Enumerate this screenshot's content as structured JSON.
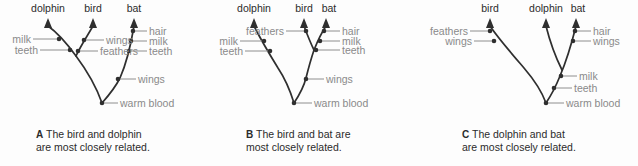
{
  "figure": {
    "background_color": "#fdfdfd",
    "branch_color": "#2f2f2f",
    "trait_label_color": "#8a8a8a",
    "taxon_label_color": "#2b2b2b"
  },
  "panels": [
    {
      "letter": "A",
      "caption_line1": "The bird and dolphin",
      "caption_line2": "are most closely related.",
      "taxa": [
        "dolphin",
        "bird",
        "bat"
      ],
      "traits_left": [
        "milk",
        "teeth"
      ],
      "traits_mid": [
        "wings",
        "feathers"
      ],
      "traits_right": [
        "hair",
        "milk",
        "teeth"
      ],
      "traits_stem": [
        "wings",
        "warm blood"
      ]
    },
    {
      "letter": "B",
      "caption_line1": "The bird and bat are",
      "caption_line2": "most closely related.",
      "taxa": [
        "dolphin",
        "bird",
        "bat"
      ],
      "traits_left": [
        "milk",
        "teeth"
      ],
      "traits_mid": [
        "feathers"
      ],
      "traits_right": [
        "hair",
        "milk",
        "teeth"
      ],
      "traits_stem": [
        "wings",
        "warm blood"
      ]
    },
    {
      "letter": "C",
      "caption_line1": "The dolphin and bat",
      "caption_line2": "are most closely related.",
      "taxa": [
        "bird",
        "dolphin",
        "bat"
      ],
      "traits_left": [
        "feathers",
        "wings"
      ],
      "traits_right": [
        "hair",
        "wings"
      ],
      "traits_stem": [
        "milk",
        "teeth",
        "warm blood"
      ]
    }
  ]
}
